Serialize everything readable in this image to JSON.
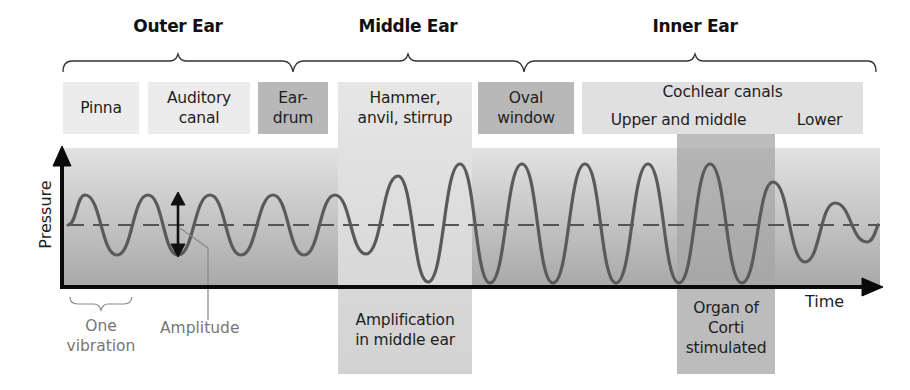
{
  "regions": {
    "outer": "Outer Ear",
    "middle": "Middle Ear",
    "inner": "Inner Ear"
  },
  "structures": {
    "pinna": [
      "Pinna"
    ],
    "auditory_canal": [
      "Auditory",
      "canal"
    ],
    "eardrum": [
      "Ear-",
      "drum"
    ],
    "ossicles": [
      "Hammer,",
      "anvil, stirrup"
    ],
    "oval_window": [
      "Oval",
      "window"
    ],
    "cochlear_canals": "Cochlear canals",
    "upper_middle": "Upper and middle",
    "lower": "Lower"
  },
  "axes": {
    "y_label": "Pressure",
    "x_label": "Time"
  },
  "annotations": {
    "one_vibration": [
      "One",
      "vibration"
    ],
    "amplitude": "Amplitude",
    "amplification": [
      "Amplification",
      "in middle ear"
    ],
    "organ_of_corti": [
      "Organ of",
      "Corti",
      "stimulated"
    ]
  },
  "colors": {
    "box_light": "#ececec",
    "box_mid": "#dcdcdc",
    "box_dark": "#b4b4b4",
    "plot_top": "#dedede",
    "plot_bottom": "#a9a9a9",
    "middle_band": "#d8d8d8",
    "corti_band": "#a3a3a3",
    "wave": "#5a5a5a",
    "annotation_gray": "#777777"
  },
  "wave": {
    "baseline_y": 225,
    "peaks": [
      {
        "x": 85,
        "y": 195
      },
      {
        "x": 148,
        "y": 195
      },
      {
        "x": 210,
        "y": 195
      },
      {
        "x": 273,
        "y": 195
      },
      {
        "x": 335,
        "y": 195
      },
      {
        "x": 398,
        "y": 176
      },
      {
        "x": 460,
        "y": 164
      },
      {
        "x": 522,
        "y": 164
      },
      {
        "x": 585,
        "y": 164
      },
      {
        "x": 648,
        "y": 164
      },
      {
        "x": 710,
        "y": 164
      },
      {
        "x": 773,
        "y": 182
      },
      {
        "x": 835,
        "y": 203
      }
    ],
    "troughs": [
      {
        "x": 117,
        "y": 255
      },
      {
        "x": 178,
        "y": 255
      },
      {
        "x": 241,
        "y": 255
      },
      {
        "x": 304,
        "y": 255
      },
      {
        "x": 366,
        "y": 254
      },
      {
        "x": 428,
        "y": 282
      },
      {
        "x": 490,
        "y": 283
      },
      {
        "x": 553,
        "y": 283
      },
      {
        "x": 616,
        "y": 283
      },
      {
        "x": 679,
        "y": 283
      },
      {
        "x": 742,
        "y": 283
      },
      {
        "x": 805,
        "y": 262
      },
      {
        "x": 867,
        "y": 242
      }
    ]
  }
}
